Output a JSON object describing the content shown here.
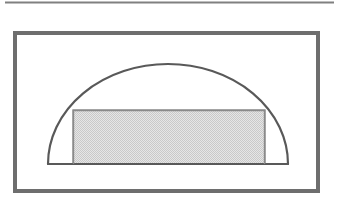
{
  "document": {
    "title": "Inscribed Rectangle in a Semicircle",
    "background_color": "#ffffff",
    "width": 339,
    "height": 202
  },
  "rule": {
    "name": "top-horizontal-rule",
    "x1": 5,
    "y1": 2.5,
    "x2": 334,
    "y2": 2.5,
    "color": "#808080",
    "stroke_width": 2.2
  },
  "frame": {
    "name": "figure-border-frame",
    "x": 15,
    "y": 33,
    "width": 303,
    "height": 158,
    "color": "#6e6e6e",
    "stroke_width": 4,
    "fill": "#ffffff"
  },
  "chart_data": {
    "type": "diagram",
    "shapes": [
      {
        "id": "semicircle",
        "type": "semicircle",
        "center_x": 168,
        "center_y": 164,
        "radius_x": 120,
        "radius_y": 100,
        "baseline_y": 164,
        "baseline_x1": 48,
        "baseline_x2": 288,
        "apex_x": 168,
        "apex_y": 64,
        "stroke": "#595959",
        "stroke_width": 2.2,
        "fill": "none"
      },
      {
        "id": "inscribed-rectangle",
        "type": "rectangle",
        "x": 73,
        "y": 110,
        "width": 192,
        "height": 54,
        "left": 73,
        "right": 265,
        "top": 110,
        "bottom": 164,
        "stroke": "#8a8a8a",
        "stroke_width": 1.4,
        "fill": "#d9d9d9",
        "fill_pattern": "dither-checker"
      }
    ],
    "colors": {
      "stroke_dark": "#595959",
      "stroke_mid": "#6e6e6e",
      "stroke_light": "#8a8a8a",
      "fill_gray": "#d9d9d9",
      "rule_gray": "#808080",
      "background": "#ffffff"
    },
    "xlim": [
      0,
      339
    ],
    "ylim": [
      0,
      202
    ],
    "grid": false,
    "legend": null,
    "labels": []
  }
}
